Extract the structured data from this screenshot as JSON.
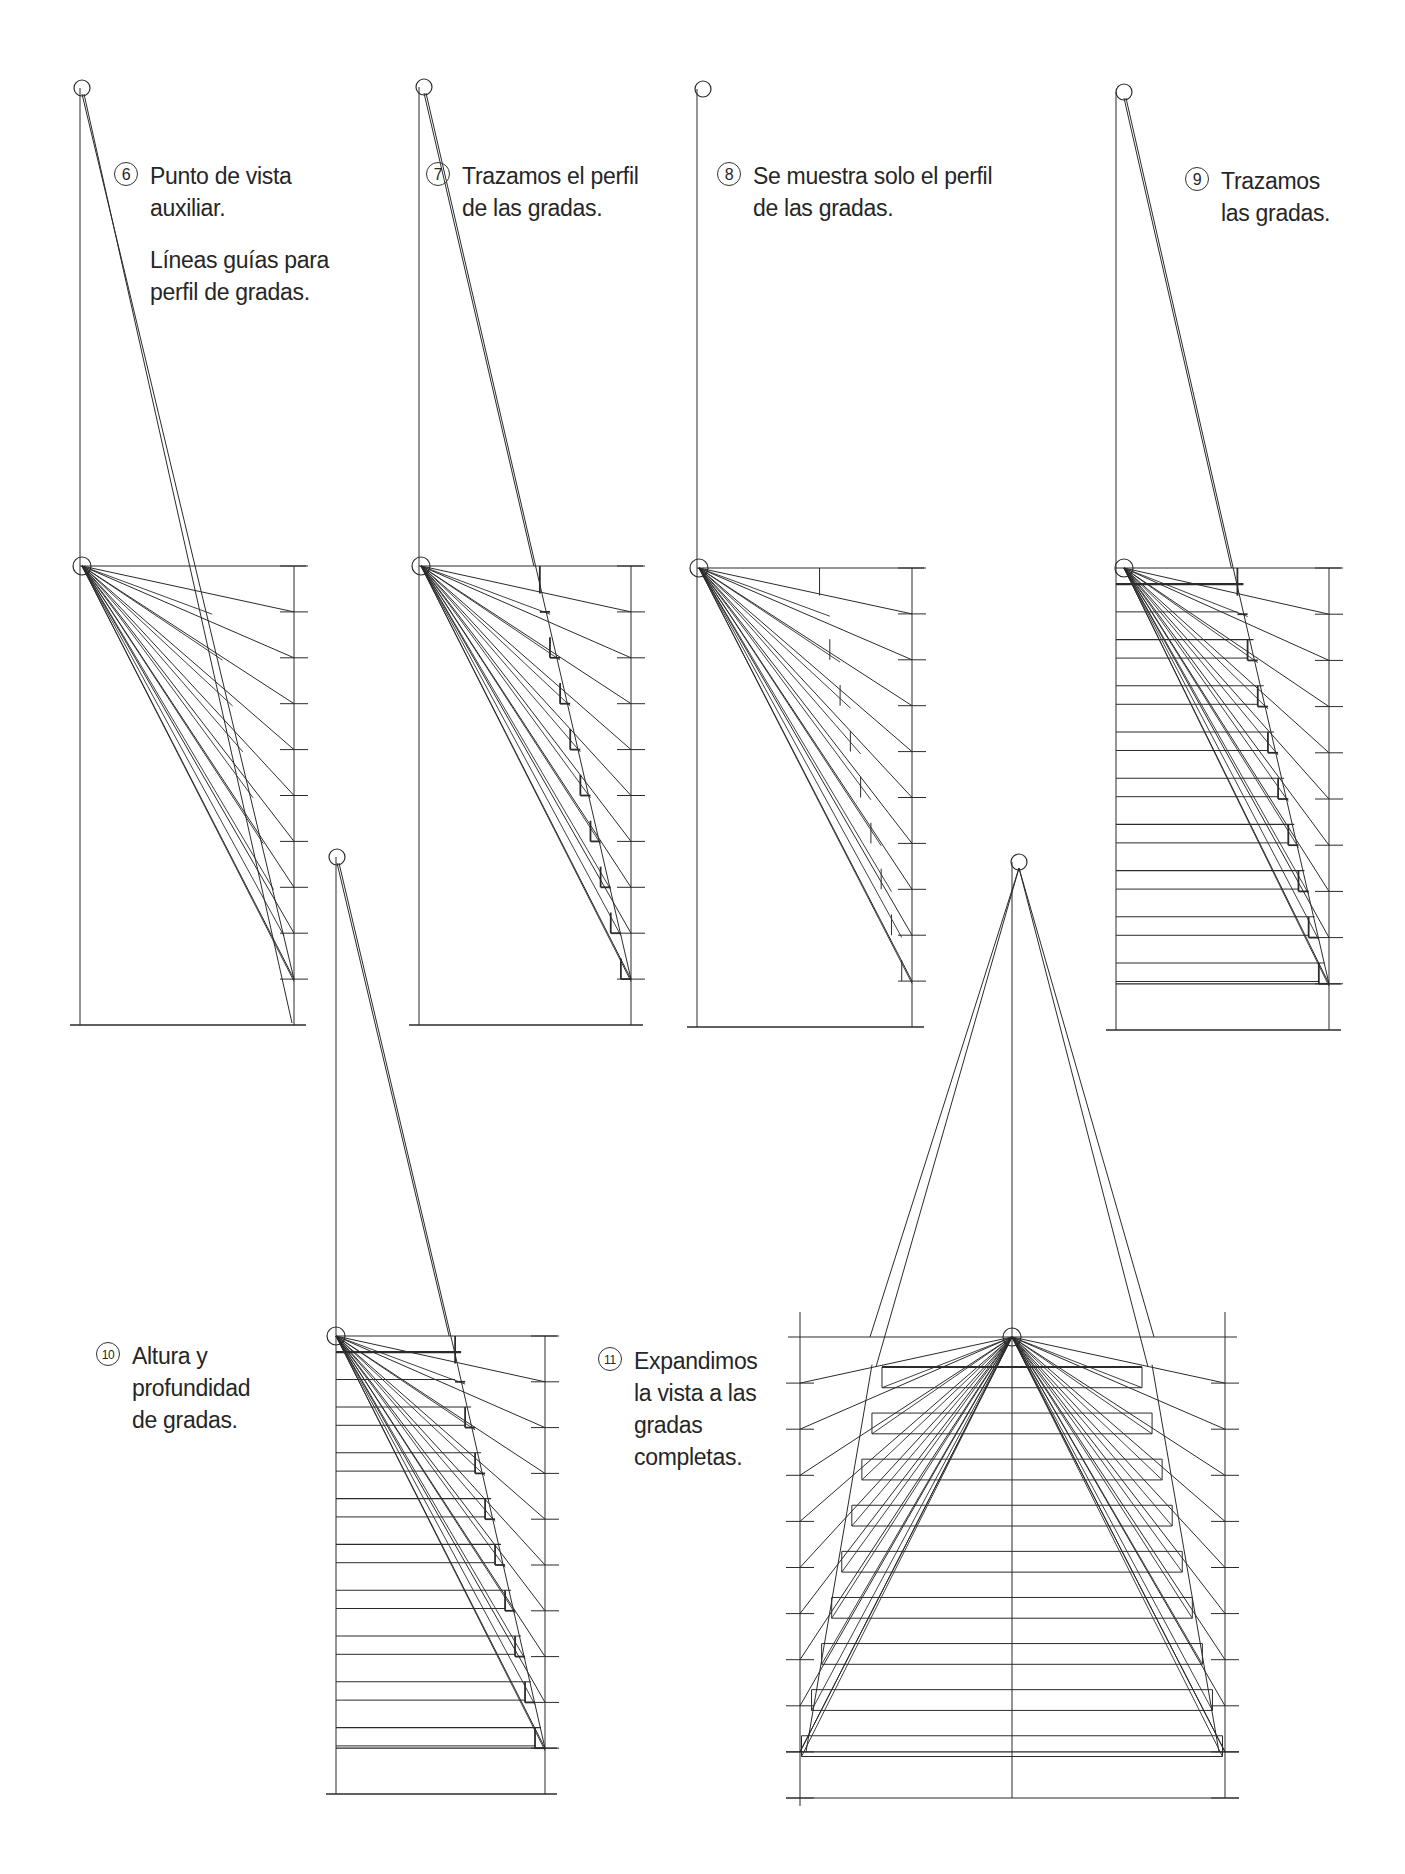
{
  "colors": {
    "ink": "#2b2b2b",
    "background": "#ffffff"
  },
  "panels": [
    {
      "id": "6",
      "caption": {
        "number": "6",
        "lines": [
          "Punto de vista",
          "auxiliar."
        ],
        "extra_lines": [
          "Líneas guías para",
          "perfil de gradas."
        ],
        "x": 150,
        "y": 160
      },
      "top_eye": [
        82,
        88
      ],
      "eye": [
        82,
        566
      ],
      "left": 80,
      "right": 294,
      "top": 566,
      "bottom": 1025,
      "ticks": 10,
      "ground_index": 10,
      "mode": "guides"
    },
    {
      "id": "7",
      "caption": {
        "number": "7",
        "lines": [
          "Trazamos el perfil",
          "de las gradas."
        ],
        "x": 462,
        "y": 160
      },
      "top_eye": [
        424,
        87
      ],
      "eye": [
        421,
        566
      ],
      "left": 419,
      "right": 631,
      "top": 566,
      "bottom": 1025,
      "ticks": 10,
      "mode": "profile_trace"
    },
    {
      "id": "8",
      "caption": {
        "number": "8",
        "lines": [
          "Se muestra solo el perfil",
          "de las gradas."
        ],
        "x": 753,
        "y": 160
      },
      "top_eye": [
        703,
        89
      ],
      "eye": [
        699,
        568
      ],
      "left": 697,
      "right": 912,
      "top": 568,
      "bottom": 1027,
      "ticks": 10,
      "mode": "profile_only"
    },
    {
      "id": "9",
      "caption": {
        "number": "9",
        "lines": [
          "Trazamos",
          "las gradas."
        ],
        "x": 1221,
        "y": 165
      },
      "top_eye": [
        1124,
        92
      ],
      "eye": [
        1124,
        568
      ],
      "left": 1116,
      "right": 1329,
      "top": 568,
      "bottom": 1030,
      "ticks": 10,
      "mode": "steps"
    },
    {
      "id": "10",
      "caption": {
        "number": "10",
        "lines": [
          "Altura y",
          "profundidad",
          "de gradas."
        ],
        "x": 132,
        "y": 1340
      },
      "top_eye": [
        337,
        857
      ],
      "eye": [
        336,
        1336
      ],
      "left": 336,
      "right": 545,
      "top": 1336,
      "bottom": 1794,
      "ticks": 10,
      "mode": "steps"
    },
    {
      "id": "11",
      "caption": {
        "number": "11",
        "lines": [
          "Expandimos",
          "la vista a las",
          "gradas",
          "completas."
        ],
        "x": 634,
        "y": 1345
      },
      "top_eye": [
        1019,
        862
      ],
      "eye": [
        1012,
        1337
      ],
      "left": 800,
      "right": 1225,
      "top": 1337,
      "bottom": 1798,
      "ticks": 10,
      "mode": "full"
    }
  ]
}
